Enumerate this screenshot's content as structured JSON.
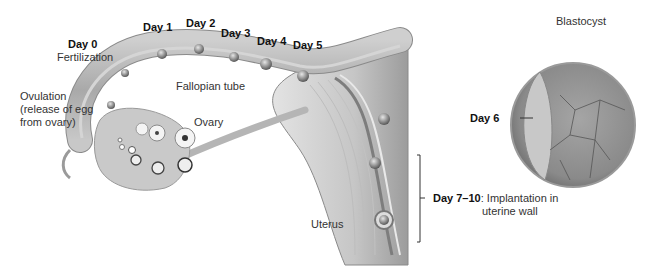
{
  "labels": {
    "day0": "Day 0",
    "fertilization": "Fertilization",
    "day1": "Day 1",
    "day2": "Day 2",
    "day3": "Day 3",
    "day4": "Day 4",
    "day5": "Day 5",
    "day6": "Day 6",
    "day7_10": "Day 7–10",
    "implantation_line1": ": Implantation in",
    "implantation_line2": "uterine wall",
    "ovulation_line1": "Ovulation",
    "ovulation_line2": "(release of egg",
    "ovulation_line3": "from ovary)",
    "fallopian_tube": "Fallopian tube",
    "ovary": "Ovary",
    "uterus": "Uterus",
    "blastocyst": "Blastocyst"
  },
  "colors": {
    "tissue_light": "#d9d9d9",
    "tissue_mid": "#b8b8b8",
    "tissue_dark": "#8f8f8f",
    "outline": "#7a7a7a",
    "text": "#222222"
  }
}
